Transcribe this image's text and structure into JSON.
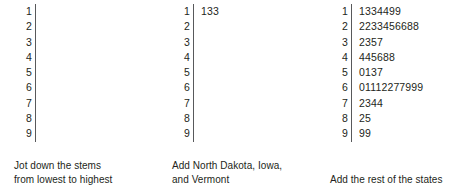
{
  "figure": {
    "type": "stem-and-leaf-plot-sequence",
    "background": "#ffffff",
    "text_color": "#231f20",
    "rule_color": "#58595b"
  },
  "panels": [
    {
      "id": "panel-stems-only",
      "caption": "Jot down the stems\nfrom lowest to highest",
      "rows": [
        {
          "stem": "1",
          "leaves": ""
        },
        {
          "stem": "2",
          "leaves": ""
        },
        {
          "stem": "3",
          "leaves": ""
        },
        {
          "stem": "4",
          "leaves": ""
        },
        {
          "stem": "5",
          "leaves": ""
        },
        {
          "stem": "6",
          "leaves": ""
        },
        {
          "stem": "7",
          "leaves": ""
        },
        {
          "stem": "8",
          "leaves": ""
        },
        {
          "stem": "9",
          "leaves": ""
        }
      ]
    },
    {
      "id": "panel-three-states",
      "caption": "Add North Dakota, Iowa,\nand Vermont",
      "rows": [
        {
          "stem": "1",
          "leaves": "133"
        },
        {
          "stem": "2",
          "leaves": ""
        },
        {
          "stem": "3",
          "leaves": ""
        },
        {
          "stem": "4",
          "leaves": ""
        },
        {
          "stem": "5",
          "leaves": ""
        },
        {
          "stem": "6",
          "leaves": ""
        },
        {
          "stem": "7",
          "leaves": ""
        },
        {
          "stem": "8",
          "leaves": ""
        },
        {
          "stem": "9",
          "leaves": ""
        }
      ]
    },
    {
      "id": "panel-all-states",
      "caption": "Add the rest of the states",
      "rows": [
        {
          "stem": "1",
          "leaves": "1334499"
        },
        {
          "stem": "2",
          "leaves": "2233456688"
        },
        {
          "stem": "3",
          "leaves": "2357"
        },
        {
          "stem": "4",
          "leaves": "445688"
        },
        {
          "stem": "5",
          "leaves": "0137"
        },
        {
          "stem": "6",
          "leaves": "01112277999"
        },
        {
          "stem": "7",
          "leaves": "2344"
        },
        {
          "stem": "8",
          "leaves": "25"
        },
        {
          "stem": "9",
          "leaves": "99"
        }
      ]
    }
  ]
}
